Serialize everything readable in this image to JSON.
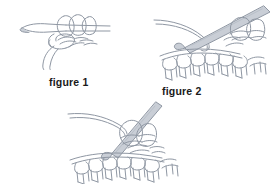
{
  "page": {
    "background_color": "#ffffff",
    "line_color": "#8f97a3",
    "hook_fill_color": "#c9ced6",
    "caption_color": "#1a1a1a"
  },
  "figures": [
    {
      "id": "figure-1",
      "caption": "figure 1",
      "description": "slip knot with loops on horizontal crochet hook and hanging yarn tail",
      "has_caption": true
    },
    {
      "id": "figure-2",
      "caption": "figure 2",
      "description": "crochet hook angled down-left inserted into a row of stitches with working yarn",
      "has_caption": true
    },
    {
      "id": "figure-3",
      "caption": "",
      "description": "crochet hook angled down-left through loops above a row of completed stitches",
      "has_caption": false
    }
  ]
}
